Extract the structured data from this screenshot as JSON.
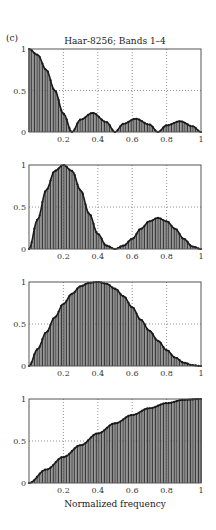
{
  "figure": {
    "panel_label": "(c)",
    "title": "Haar-8256; Bands 1–4",
    "xlabel": "Normalized frequency"
  },
  "chart_data": [
    {
      "type": "bar",
      "name": "Band 1",
      "title": "Haar-8256; Bands 1–4",
      "xlabel": "",
      "ylabel": "",
      "xlim": [
        0,
        1
      ],
      "ylim": [
        0,
        1
      ],
      "xticks": [
        "0.2",
        "0.4",
        "0.6",
        "0.8",
        "1"
      ],
      "yticks": [
        "0",
        "0.5",
        "1"
      ],
      "grid": true,
      "x": [
        0,
        0.05,
        0.1,
        0.15,
        0.2,
        0.25,
        0.3,
        0.37,
        0.45,
        0.5,
        0.55,
        0.62,
        0.7,
        0.75,
        0.8,
        0.88,
        0.95,
        1.0
      ],
      "values": [
        1,
        0.93,
        0.75,
        0.5,
        0.22,
        0.0,
        0.15,
        0.23,
        0.12,
        0.0,
        0.1,
        0.16,
        0.09,
        0.0,
        0.08,
        0.13,
        0.07,
        0.0
      ]
    },
    {
      "type": "bar",
      "name": "Band 2",
      "xlim": [
        0,
        1
      ],
      "ylim": [
        0,
        1
      ],
      "xticks": [
        "0.2",
        "0.4",
        "0.6",
        "0.8",
        "1"
      ],
      "yticks": [
        "0",
        "0.5",
        "1"
      ],
      "grid": true,
      "x": [
        0,
        0.05,
        0.1,
        0.15,
        0.2,
        0.25,
        0.3,
        0.35,
        0.4,
        0.45,
        0.5,
        0.55,
        0.6,
        0.65,
        0.7,
        0.75,
        0.8,
        0.85,
        0.9,
        0.95,
        1.0
      ],
      "values": [
        0,
        0.35,
        0.7,
        0.93,
        1.0,
        0.93,
        0.7,
        0.42,
        0.18,
        0.04,
        0.0,
        0.04,
        0.12,
        0.24,
        0.33,
        0.37,
        0.33,
        0.24,
        0.12,
        0.03,
        0.0
      ]
    },
    {
      "type": "bar",
      "name": "Band 3",
      "xlim": [
        0,
        1
      ],
      "ylim": [
        0,
        1
      ],
      "xticks": [
        "0.2",
        "0.4",
        "0.6",
        "0.8",
        "1"
      ],
      "yticks": [
        "0",
        "0.5",
        "1"
      ],
      "grid": true,
      "x": [
        0,
        0.05,
        0.1,
        0.15,
        0.2,
        0.25,
        0.3,
        0.35,
        0.4,
        0.45,
        0.5,
        0.55,
        0.6,
        0.65,
        0.7,
        0.75,
        0.8,
        0.85,
        0.9,
        0.95,
        1.0
      ],
      "values": [
        0,
        0.2,
        0.4,
        0.58,
        0.74,
        0.86,
        0.95,
        0.99,
        1.0,
        0.98,
        0.92,
        0.83,
        0.7,
        0.55,
        0.42,
        0.3,
        0.19,
        0.1,
        0.04,
        0.01,
        0.0
      ]
    },
    {
      "type": "bar",
      "name": "Band 4",
      "xlabel": "Normalized frequency",
      "xlim": [
        0,
        1
      ],
      "ylim": [
        0,
        1
      ],
      "xticks": [
        "0.2",
        "0.4",
        "0.6",
        "0.8",
        "1"
      ],
      "yticks": [
        "0",
        "0.5",
        "1"
      ],
      "grid": true,
      "x": [
        0,
        0.1,
        0.2,
        0.3,
        0.4,
        0.5,
        0.6,
        0.7,
        0.8,
        0.9,
        1.0
      ],
      "values": [
        0,
        0.16,
        0.31,
        0.45,
        0.59,
        0.71,
        0.81,
        0.89,
        0.95,
        0.99,
        1.0
      ]
    }
  ],
  "colors": {
    "bar_fill": "#8a8a8a",
    "bar_stripe": "#3a3a3a",
    "curve": "#1a1a1a",
    "axis": "#555555",
    "grid": "#777777"
  }
}
